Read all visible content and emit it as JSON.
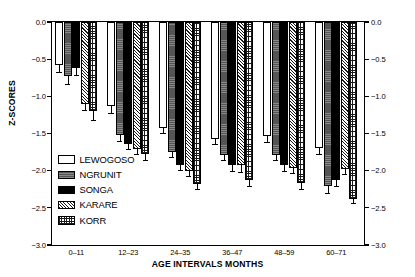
{
  "chart_data": {
    "type": "bar",
    "title": "",
    "xlabel": "AGE INTERVALS MONTHS",
    "ylabel": "Z-SCORES",
    "ylim": [
      -3.0,
      0.0
    ],
    "yticks": [
      "0.0",
      "-0.5",
      "-1.0",
      "-1.5",
      "-2.0",
      "-2.5",
      "-3.0"
    ],
    "ytick_values": [
      0.0,
      -0.5,
      -1.0,
      -1.5,
      -2.0,
      -2.5,
      -3.0
    ],
    "grid": false,
    "legend_position": "inside-lower-left",
    "dual_y_axis": true,
    "categories": [
      "0–11",
      "12–23",
      "24–35",
      "36–47",
      "48–59",
      "60–71"
    ],
    "series": [
      {
        "name": "LEWOGOSO",
        "fill": "white",
        "values": [
          -0.58,
          -1.13,
          -1.43,
          -1.57,
          -1.54,
          -1.7
        ],
        "errors": [
          0.09,
          0.09,
          0.06,
          0.07,
          0.07,
          0.07
        ]
      },
      {
        "name": "NGRUNIT",
        "fill": "dark-gray",
        "values": [
          -0.73,
          -1.52,
          -1.75,
          -1.79,
          -1.79,
          -2.2
        ],
        "errors": [
          0.11,
          0.08,
          0.06,
          0.07,
          0.07,
          0.1
        ]
      },
      {
        "name": "SONGA",
        "fill": "black",
        "values": [
          -0.62,
          -1.64,
          -1.92,
          -1.93,
          -1.93,
          -2.12
        ],
        "errors": [
          0.09,
          0.07,
          0.07,
          0.07,
          0.07,
          0.08
        ]
      },
      {
        "name": "KARARE",
        "fill": "diagonal-hatch",
        "values": [
          -1.1,
          -1.71,
          -2.0,
          -1.93,
          -1.96,
          -1.98
        ],
        "errors": [
          0.09,
          0.07,
          0.07,
          0.09,
          0.07,
          0.06
        ]
      },
      {
        "name": "KORR",
        "fill": "cross-grid-hatch",
        "values": [
          -1.2,
          -1.78,
          -2.18,
          -2.13,
          -2.17,
          -2.38
        ],
        "errors": [
          0.12,
          0.07,
          0.07,
          0.07,
          0.07,
          0.06
        ]
      }
    ]
  },
  "axes": {
    "left_labels": [
      "0.0",
      "-0.5",
      "-1.0",
      "-1.5",
      "-2.0",
      "-2.5",
      "-3.0"
    ],
    "right_labels": [
      "0.0",
      "-0.5",
      "-1.0",
      "-1.5",
      "-2.0",
      "-2.5",
      "-3.0"
    ]
  },
  "colors": {
    "lewogoso": "#ffffff",
    "ngrunit": "#555555",
    "songa": "#000000",
    "karare": "#dcdcdc",
    "korr": "#ffffff",
    "axis": "#000000",
    "background": "#ffffff"
  }
}
